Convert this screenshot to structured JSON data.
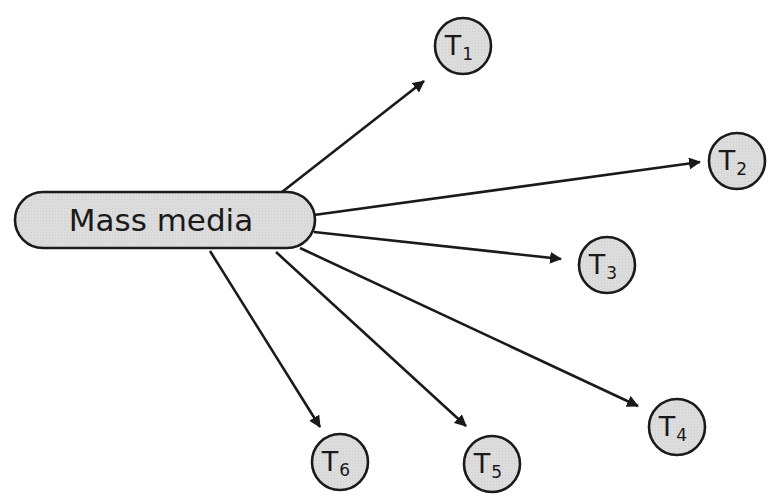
{
  "diagram": {
    "type": "hub-and-spoke",
    "colors": {
      "node_fill": "#dcdcdc",
      "stroke": "#1a1a1a",
      "background": "#ffffff"
    },
    "source": {
      "label": "Mass media",
      "x": 15,
      "y": 192,
      "w": 300,
      "h": 56
    },
    "targets": [
      {
        "id": "T1",
        "base": "T",
        "sub": "1",
        "cx": 463,
        "cy": 46,
        "r": 28
      },
      {
        "id": "T2",
        "base": "T",
        "sub": "2",
        "cx": 737,
        "cy": 161,
        "r": 28
      },
      {
        "id": "T3",
        "base": "T",
        "sub": "3",
        "cx": 607,
        "cy": 265,
        "r": 28
      },
      {
        "id": "T4",
        "base": "T",
        "sub": "4",
        "cx": 677,
        "cy": 427,
        "r": 28
      },
      {
        "id": "T5",
        "base": "T",
        "sub": "5",
        "cx": 492,
        "cy": 464,
        "r": 28
      },
      {
        "id": "T6",
        "base": "T",
        "sub": "6",
        "cx": 340,
        "cy": 462,
        "r": 28
      }
    ],
    "edges": [
      {
        "to": "T1",
        "x1": 282,
        "y1": 192,
        "x2": 424,
        "y2": 81
      },
      {
        "to": "T2",
        "x1": 314,
        "y1": 215,
        "x2": 700,
        "y2": 162
      },
      {
        "to": "T3",
        "x1": 314,
        "y1": 232,
        "x2": 561,
        "y2": 259
      },
      {
        "to": "T4",
        "x1": 300,
        "y1": 248,
        "x2": 638,
        "y2": 406
      },
      {
        "to": "T5",
        "x1": 276,
        "y1": 252,
        "x2": 466,
        "y2": 426
      },
      {
        "to": "T6",
        "x1": 210,
        "y1": 251,
        "x2": 320,
        "y2": 427
      }
    ]
  }
}
